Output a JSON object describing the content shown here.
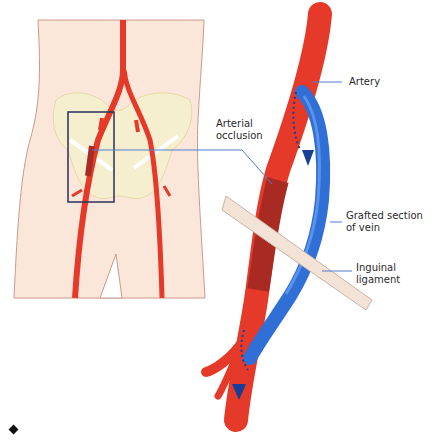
{
  "diagram": {
    "labels": {
      "artery": "Artery",
      "arterial_occlusion": "Arterial\nocclusion",
      "grafted_vein": "Grafted section\nof vein",
      "inguinal_ligament": "Inguinal\nligament"
    },
    "colors": {
      "skin": "#fbe7da",
      "skin_outline": "#c99a8a",
      "pelvis": "#f6efcf",
      "pelvis_outline": "#e6d9a6",
      "artery": "#e53a2a",
      "artery_dark": "#a92a22",
      "vein": "#2f6fd6",
      "vein_dark": "#173f95",
      "ligament": "#f3e2d6",
      "leader_line": "#4f7fd0",
      "box_outline": "#2a2f5a"
    },
    "bullet": "diamond"
  }
}
